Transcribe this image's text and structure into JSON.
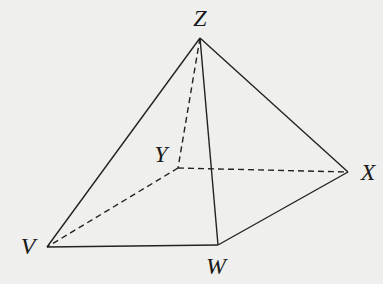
{
  "diagram": {
    "type": "square-based pyramid",
    "vertices": [
      {
        "id": "Z",
        "label": "Z",
        "x": 200,
        "y": 38,
        "label_x": 200,
        "label_y": 26
      },
      {
        "id": "Y",
        "label": "Y",
        "x": 178,
        "y": 168,
        "label_x": 161,
        "label_y": 162
      },
      {
        "id": "X",
        "label": "X",
        "x": 348,
        "y": 172,
        "label_x": 368,
        "label_y": 180
      },
      {
        "id": "V",
        "label": "V",
        "x": 47,
        "y": 247,
        "label_x": 28,
        "label_y": 254
      },
      {
        "id": "W",
        "label": "W",
        "x": 218,
        "y": 245,
        "label_x": 216,
        "label_y": 274
      }
    ],
    "edges": [
      {
        "from": "Z",
        "to": "V",
        "style": "solid"
      },
      {
        "from": "Z",
        "to": "W",
        "style": "solid"
      },
      {
        "from": "Z",
        "to": "X",
        "style": "solid"
      },
      {
        "from": "V",
        "to": "W",
        "style": "solid"
      },
      {
        "from": "W",
        "to": "X",
        "style": "solid"
      },
      {
        "from": "Z",
        "to": "Y",
        "style": "dashed"
      },
      {
        "from": "Y",
        "to": "X",
        "style": "dashed"
      },
      {
        "from": "Y",
        "to": "V",
        "style": "dashed"
      }
    ],
    "colors": {
      "background": "#efefed",
      "line": "#222222",
      "label": "#1a1a1a"
    }
  }
}
